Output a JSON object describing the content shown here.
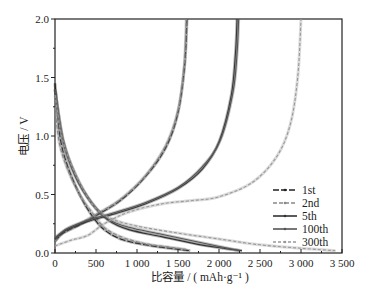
{
  "chart_data": {
    "type": "line",
    "title": "",
    "xlabel": "比容量 / ( mAh·g⁻¹ )",
    "ylabel": "电压 / V",
    "xlim": [
      0,
      3500
    ],
    "ylim": [
      0,
      2.0
    ],
    "x_ticks": [
      0,
      500,
      1000,
      1500,
      2000,
      2500,
      3000,
      3500
    ],
    "x_tick_labels": [
      "0",
      "500",
      "1 000",
      "1 500",
      "2 000",
      "2 500",
      "3 000",
      "3 500"
    ],
    "y_ticks": [
      0.0,
      0.5,
      1.0,
      1.5,
      2.0
    ],
    "y_tick_labels": [
      "0.0",
      "0.5",
      "1.0",
      "1.5",
      "2.0"
    ],
    "grid": false,
    "legend_position": "lower right (inside)",
    "series": [
      {
        "name": "1st",
        "color": "#222222",
        "dash": "6,2",
        "discharge": [
          [
            0,
            1.45
          ],
          [
            60,
            1.0
          ],
          [
            150,
            0.75
          ],
          [
            300,
            0.5
          ],
          [
            450,
            0.32
          ],
          [
            600,
            0.2
          ],
          [
            800,
            0.12
          ],
          [
            1100,
            0.07
          ],
          [
            1400,
            0.04
          ],
          [
            1650,
            0.02
          ]
        ],
        "charge": [
          [
            0,
            0.1
          ],
          [
            100,
            0.17
          ],
          [
            300,
            0.24
          ],
          [
            500,
            0.32
          ],
          [
            800,
            0.45
          ],
          [
            1100,
            0.65
          ],
          [
            1350,
            0.9
          ],
          [
            1500,
            1.2
          ],
          [
            1580,
            1.6
          ],
          [
            1610,
            2.0
          ]
        ]
      },
      {
        "name": "2nd",
        "color": "#888888",
        "dash": "4,2",
        "discharge": [
          [
            0,
            1.25
          ],
          [
            50,
            0.95
          ],
          [
            150,
            0.72
          ],
          [
            300,
            0.5
          ],
          [
            450,
            0.35
          ],
          [
            600,
            0.22
          ],
          [
            800,
            0.14
          ],
          [
            1100,
            0.08
          ],
          [
            1400,
            0.05
          ],
          [
            1600,
            0.03
          ]
        ],
        "charge": [
          [
            0,
            0.1
          ],
          [
            100,
            0.18
          ],
          [
            300,
            0.25
          ],
          [
            500,
            0.33
          ],
          [
            800,
            0.46
          ],
          [
            1100,
            0.66
          ],
          [
            1350,
            0.92
          ],
          [
            1500,
            1.22
          ],
          [
            1575,
            1.6
          ],
          [
            1600,
            2.0
          ]
        ]
      },
      {
        "name": "5th",
        "color": "#333333",
        "dash": "",
        "discharge": [
          [
            0,
            1.4
          ],
          [
            100,
            0.95
          ],
          [
            250,
            0.65
          ],
          [
            450,
            0.42
          ],
          [
            650,
            0.28
          ],
          [
            900,
            0.2
          ],
          [
            1300,
            0.14
          ],
          [
            1700,
            0.08
          ],
          [
            2050,
            0.04
          ],
          [
            2280,
            0.02
          ]
        ],
        "charge": [
          [
            0,
            0.12
          ],
          [
            150,
            0.2
          ],
          [
            400,
            0.27
          ],
          [
            700,
            0.33
          ],
          [
            1100,
            0.42
          ],
          [
            1500,
            0.55
          ],
          [
            1800,
            0.72
          ],
          [
            2000,
            0.95
          ],
          [
            2150,
            1.35
          ],
          [
            2200,
            1.7
          ],
          [
            2220,
            2.0
          ]
        ]
      },
      {
        "name": "100th",
        "color": "#555555",
        "dash": "",
        "discharge": [
          [
            0,
            1.4
          ],
          [
            100,
            0.97
          ],
          [
            250,
            0.67
          ],
          [
            450,
            0.43
          ],
          [
            650,
            0.29
          ],
          [
            900,
            0.22
          ],
          [
            1300,
            0.16
          ],
          [
            1700,
            0.1
          ],
          [
            2050,
            0.05
          ],
          [
            2250,
            0.02
          ]
        ],
        "charge": [
          [
            0,
            0.13
          ],
          [
            150,
            0.21
          ],
          [
            400,
            0.28
          ],
          [
            700,
            0.34
          ],
          [
            1100,
            0.43
          ],
          [
            1500,
            0.56
          ],
          [
            1800,
            0.74
          ],
          [
            2020,
            0.97
          ],
          [
            2170,
            1.37
          ],
          [
            2220,
            1.7
          ],
          [
            2240,
            2.0
          ]
        ]
      },
      {
        "name": "300th",
        "color": "#999999",
        "dash": "3,2",
        "discharge": [
          [
            0,
            1.35
          ],
          [
            100,
            0.95
          ],
          [
            300,
            0.6
          ],
          [
            500,
            0.38
          ],
          [
            700,
            0.29
          ],
          [
            1000,
            0.23
          ],
          [
            1500,
            0.17
          ],
          [
            2000,
            0.12
          ],
          [
            2500,
            0.07
          ],
          [
            3000,
            0.04
          ],
          [
            3420,
            0.02
          ]
        ],
        "charge": [
          [
            0,
            0.06
          ],
          [
            200,
            0.11
          ],
          [
            400,
            0.15
          ],
          [
            600,
            0.25
          ],
          [
            900,
            0.35
          ],
          [
            1300,
            0.42
          ],
          [
            1700,
            0.45
          ],
          [
            2000,
            0.48
          ],
          [
            2400,
            0.6
          ],
          [
            2700,
            0.82
          ],
          [
            2870,
            1.1
          ],
          [
            2960,
            1.5
          ],
          [
            3000,
            2.0
          ]
        ]
      }
    ]
  },
  "legend": {
    "items": [
      "1st",
      "2nd",
      "5th",
      "100th",
      "300th"
    ]
  },
  "axes": {
    "xlabel": "比容量 / ( mAh·g⁻¹ )",
    "ylabel": "电压 / V"
  }
}
